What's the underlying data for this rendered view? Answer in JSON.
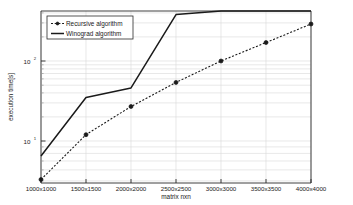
{
  "chart_data": {
    "type": "line",
    "title": "",
    "xlabel": "matrix nxn",
    "ylabel": "execution time[s]",
    "categories": [
      "1000x1000",
      "1500x1500",
      "2000x2000",
      "2500x2500",
      "3000x3000",
      "3500x3500",
      "4000x4000"
    ],
    "yscale": "log",
    "ylim": [
      3,
      900
    ],
    "ytick_labels": [
      "10^1",
      "10^2"
    ],
    "ytick_values": [
      10,
      100
    ],
    "grid": true,
    "legend_position": "top-left",
    "series": [
      {
        "name": "Recursive algorithm",
        "style": "dashed-with-markers",
        "color": "#1a1a1a",
        "values": [
          3.3,
          12,
          27,
          54,
          100,
          170,
          290
        ]
      },
      {
        "name": "Winograd algorithm",
        "style": "solid",
        "color": "#1a1a1a",
        "values": [
          6.5,
          35,
          46,
          380,
          540,
          660,
          760
        ]
      }
    ]
  },
  "legend": {
    "entries": [
      {
        "label": "Recursive algorithm"
      },
      {
        "label": "Winograd algorithm"
      }
    ]
  },
  "axes": {
    "y_title": "execution time[s]",
    "x_title": "matrix nxn",
    "y_ticks": [
      {
        "mantissa": "10",
        "exponent": "2"
      },
      {
        "mantissa": "10",
        "exponent": "1"
      }
    ],
    "x_ticks": [
      "1000x1000",
      "1500x1500",
      "2000x2000",
      "2500x2500",
      "3000x3000",
      "3500x3500",
      "4000x4000"
    ]
  }
}
